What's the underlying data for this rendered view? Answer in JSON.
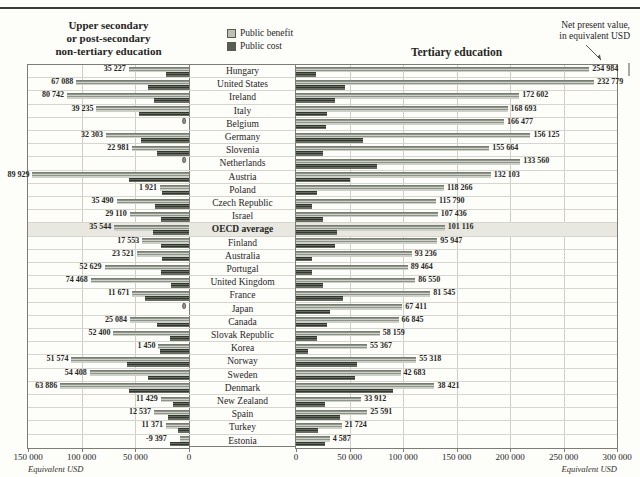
{
  "annotation": {
    "line1": "Net present value,",
    "line2": "in equivalent USD"
  },
  "left_panel": {
    "title_lines": [
      "Upper secondary",
      "or post-secondary",
      "non-tertiary education"
    ],
    "axis_ticks": [
      "150 000",
      "100 000",
      "50 000",
      "0"
    ],
    "axis_unit": "Equivalent USD"
  },
  "right_panel": {
    "title": "Tertiary education",
    "axis_ticks": [
      "0",
      "50 000",
      "100 000",
      "150 000",
      "200 000",
      "250 000",
      "300 000"
    ],
    "axis_unit": "Equivalent USD"
  },
  "legend": {
    "items": [
      {
        "label": "Public benefit",
        "color": "#bcc1b4"
      },
      {
        "label": "Public cost",
        "color": "#575e52"
      }
    ]
  },
  "colors": {
    "benefit_bar": "#bcc1b4",
    "cost_bar": "#575e52",
    "highlight_row": "#e8e7e0",
    "gridline": "#cfcfc8",
    "border": "#7d7d77"
  },
  "chart_data": {
    "type": "bar",
    "unit": "equivalent USD",
    "left_axis_max": 150000,
    "right_axis_max": 300000,
    "note": "Bars show public benefit (light) and public cost (dark); labels are net present values in equivalent USD. Benefit/cost bar values are estimated from pixel lengths; net labels are exact.",
    "rows": [
      {
        "country": "Hungary",
        "left": {
          "label": "35 227",
          "net": 35227,
          "benefit": 56227,
          "cost": 21000
        },
        "right": {
          "label": "254 984",
          "net": 254984,
          "benefit": 273984,
          "cost": 19000
        }
      },
      {
        "country": "United States",
        "left": {
          "label": "67 088",
          "net": 67088,
          "benefit": 105088,
          "cost": 38000
        },
        "right": {
          "label": "232 779",
          "net": 232779,
          "benefit": 278779,
          "cost": 46000
        }
      },
      {
        "country": "Ireland",
        "left": {
          "label": "80 742",
          "net": 80742,
          "benefit": 113742,
          "cost": 33000
        },
        "right": {
          "label": "172 602",
          "net": 172602,
          "benefit": 208602,
          "cost": 36000
        }
      },
      {
        "country": "Italy",
        "left": {
          "label": "39 235",
          "net": 39235,
          "benefit": 86235,
          "cost": 47000
        },
        "right": {
          "label": "168 693",
          "net": 168693,
          "benefit": 197693,
          "cost": 29000
        }
      },
      {
        "country": "Belgium",
        "left": {
          "label": "0",
          "net": 0,
          "benefit": 0,
          "cost": 0
        },
        "right": {
          "label": "166 477",
          "net": 166477,
          "benefit": 194477,
          "cost": 28000
        }
      },
      {
        "country": "Germany",
        "left": {
          "label": "32 303",
          "net": 32303,
          "benefit": 77303,
          "cost": 45000
        },
        "right": {
          "label": "156 125",
          "net": 156125,
          "benefit": 219125,
          "cost": 63000
        }
      },
      {
        "country": "Slovenia",
        "left": {
          "label": "22 981",
          "net": 22981,
          "benefit": 52981,
          "cost": 30000
        },
        "right": {
          "label": "155 664",
          "net": 155664,
          "benefit": 180664,
          "cost": 25000
        }
      },
      {
        "country": "Netherlands",
        "left": {
          "label": "0",
          "net": 0,
          "benefit": 0,
          "cost": 0
        },
        "right": {
          "label": "133 560",
          "net": 133560,
          "benefit": 209560,
          "cost": 76000
        }
      },
      {
        "country": "Austria",
        "left": {
          "label": "89 929",
          "net": 89929,
          "benefit": 145929,
          "cost": 56000
        },
        "right": {
          "label": "132 103",
          "net": 132103,
          "benefit": 182103,
          "cost": 50000
        }
      },
      {
        "country": "Poland",
        "left": {
          "label": "1 921",
          "net": 1921,
          "benefit": 26921,
          "cost": 25000
        },
        "right": {
          "label": "118 266",
          "net": 118266,
          "benefit": 138266,
          "cost": 20000
        }
      },
      {
        "country": "Czech Republic",
        "left": {
          "label": "35 490",
          "net": 35490,
          "benefit": 67490,
          "cost": 32000
        },
        "right": {
          "label": "115 790",
          "net": 115790,
          "benefit": 130790,
          "cost": 15000
        }
      },
      {
        "country": "Israel",
        "left": {
          "label": "29 110",
          "net": 29110,
          "benefit": 55110,
          "cost": 26000
        },
        "right": {
          "label": "107 436",
          "net": 107436,
          "benefit": 132436,
          "cost": 25000
        }
      },
      {
        "country": "OECD average",
        "highlight": true,
        "left": {
          "label": "35 544",
          "net": 35544,
          "benefit": 69544,
          "cost": 34000
        },
        "right": {
          "label": "101 116",
          "net": 101116,
          "benefit": 139116,
          "cost": 38000
        }
      },
      {
        "country": "Finland",
        "left": {
          "label": "17 553",
          "net": 17553,
          "benefit": 43553,
          "cost": 26000
        },
        "right": {
          "label": "95 947",
          "net": 95947,
          "benefit": 131947,
          "cost": 36000
        }
      },
      {
        "country": "Australia",
        "left": {
          "label": "23 521",
          "net": 23521,
          "benefit": 48521,
          "cost": 25000
        },
        "right": {
          "label": "93 236",
          "net": 93236,
          "benefit": 108236,
          "cost": 15000
        }
      },
      {
        "country": "Portugal",
        "left": {
          "label": "52 629",
          "net": 52629,
          "benefit": 78629,
          "cost": 26000
        },
        "right": {
          "label": "89 464",
          "net": 89464,
          "benefit": 104464,
          "cost": 15000
        }
      },
      {
        "country": "United Kingdom",
        "left": {
          "label": "74 468",
          "net": 74468,
          "benefit": 91468,
          "cost": 17000
        },
        "right": {
          "label": "86 550",
          "net": 86550,
          "benefit": 111550,
          "cost": 25000
        }
      },
      {
        "country": "France",
        "left": {
          "label": "11 671",
          "net": 11671,
          "benefit": 52671,
          "cost": 41000
        },
        "right": {
          "label": "81 545",
          "net": 81545,
          "benefit": 125545,
          "cost": 44000
        }
      },
      {
        "country": "Japan",
        "left": {
          "label": "0",
          "net": 0,
          "benefit": 0,
          "cost": 0
        },
        "right": {
          "label": "67 411",
          "net": 67411,
          "benefit": 99411,
          "cost": 32000
        }
      },
      {
        "country": "Canada",
        "left": {
          "label": "25 084",
          "net": 25084,
          "benefit": 55084,
          "cost": 30000
        },
        "right": {
          "label": "66 845",
          "net": 66845,
          "benefit": 95845,
          "cost": 29000
        }
      },
      {
        "country": "Slovak Republic",
        "left": {
          "label": "52 400",
          "net": 52400,
          "benefit": 70400,
          "cost": 18000
        },
        "right": {
          "label": "58 159",
          "net": 58159,
          "benefit": 78159,
          "cost": 20000
        }
      },
      {
        "country": "Korea",
        "left": {
          "label": "1 450",
          "net": 1450,
          "benefit": 28450,
          "cost": 27000
        },
        "right": {
          "label": "55 367",
          "net": 55367,
          "benefit": 66367,
          "cost": 11000
        }
      },
      {
        "country": "Norway",
        "left": {
          "label": "51 574",
          "net": 51574,
          "benefit": 109574,
          "cost": 58000
        },
        "right": {
          "label": "55 318",
          "net": 55318,
          "benefit": 112318,
          "cost": 57000
        }
      },
      {
        "country": "Sweden",
        "left": {
          "label": "54 408",
          "net": 54408,
          "benefit": 92408,
          "cost": 38000
        },
        "right": {
          "label": "42 683",
          "net": 42683,
          "benefit": 97683,
          "cost": 55000
        }
      },
      {
        "country": "Denmark",
        "left": {
          "label": "63 886",
          "net": 63886,
          "benefit": 119886,
          "cost": 56000
        },
        "right": {
          "label": "38 421",
          "net": 38421,
          "benefit": 129421,
          "cost": 91000
        }
      },
      {
        "country": "New Zealand",
        "left": {
          "label": "11 429",
          "net": 11429,
          "benefit": 26429,
          "cost": 15000
        },
        "right": {
          "label": "33 912",
          "net": 33912,
          "benefit": 60912,
          "cost": 27000
        }
      },
      {
        "country": "Spain",
        "left": {
          "label": "12 537",
          "net": 12537,
          "benefit": 32537,
          "cost": 20000
        },
        "right": {
          "label": "25 591",
          "net": 25591,
          "benefit": 66591,
          "cost": 41000
        }
      },
      {
        "country": "Turkey",
        "left": {
          "label": "11 371",
          "net": 11371,
          "benefit": 21371,
          "cost": 10000
        },
        "right": {
          "label": "21 724",
          "net": 21724,
          "benefit": 42724,
          "cost": 21000
        }
      },
      {
        "country": "Estonia",
        "left": {
          "label": "-9 397",
          "net": -9397,
          "benefit": 8603,
          "cost": 18000
        },
        "right": {
          "label": "4 587",
          "net": 4587,
          "benefit": 31587,
          "cost": 27000
        }
      }
    ]
  }
}
